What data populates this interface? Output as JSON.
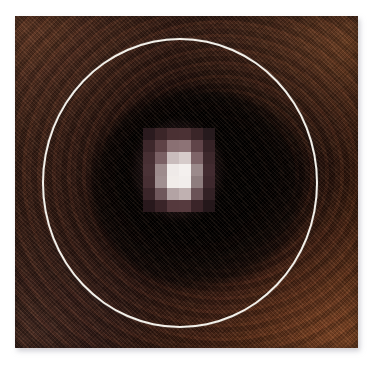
{
  "figure": {
    "kind": "astronomical-image-plate",
    "background_color": "#ffffff"
  },
  "plate": {
    "name": "image-plate",
    "left": 15,
    "top": 16,
    "width": 343,
    "height": 332,
    "dominant_color": "#3a1f15",
    "darkest_color": "#050202",
    "warm_highlight_color": "#6e4422",
    "texture": "diagonal halftone scan lines with concentric contour banding"
  },
  "aperture": {
    "name": "aperture-circle",
    "stroke_color": "#f2f0ea",
    "stroke_width_px": 2,
    "center_x": 180,
    "center_y": 183,
    "radius_x": 138,
    "radius_y": 145
  },
  "point_source": {
    "name": "point-source",
    "center_x": 178,
    "center_y": 170,
    "peak_color": "#f4f0ee",
    "halo_color": "#6a4346",
    "pixel_block_size": 12,
    "pixels": [
      [
        "#2a1a1e",
        "#3b2528",
        "#4a3033",
        "#4b3134",
        "#3a2528",
        "#261a1d"
      ],
      [
        "#3d272b",
        "#5e4246",
        "#8a7073",
        "#8d7376",
        "#604449",
        "#352226"
      ],
      [
        "#472f33",
        "#7a6064",
        "#c9bcbc",
        "#d6cbca",
        "#7e6468",
        "#3d282c"
      ],
      [
        "#4a3236",
        "#9d8b8c",
        "#efeae8",
        "#f4f0ee",
        "#9b8a8b",
        "#422b30"
      ],
      [
        "#472f33",
        "#a08f90",
        "#f1ece9",
        "#f2eeec",
        "#8e7d7e",
        "#3e282d"
      ],
      [
        "#3a2529",
        "#6f575b",
        "#b3a3a4",
        "#c0b1b1",
        "#6a5256",
        "#332125"
      ],
      [
        "#28181c",
        "#3a2428",
        "#55393d",
        "#563a3e",
        "#3a2428",
        "#24171a"
      ]
    ]
  },
  "shadow": {
    "name": "drop-shadow",
    "color": "rgba(170,170,180,0.55)",
    "offset_x": 2,
    "offset_y": 3,
    "blur": 5
  }
}
